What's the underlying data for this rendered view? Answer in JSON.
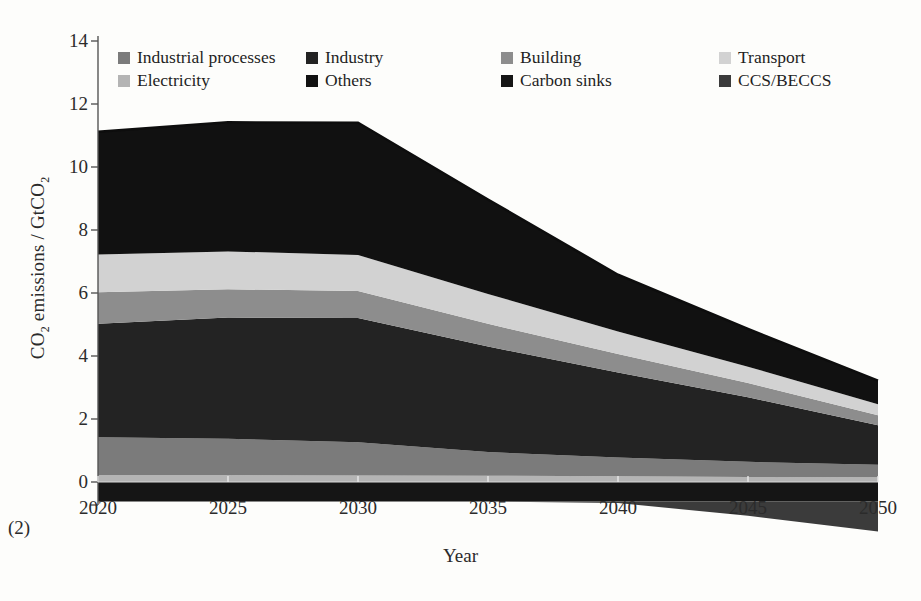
{
  "figure": {
    "corner_note": "(2)",
    "xlabel": "Year",
    "ylabel_html": "CO2 emissions / GtCO2"
  },
  "legend": {
    "position": "top-inside",
    "items": [
      {
        "label": "Industrial processes",
        "color": "#7b7b7b",
        "swatch": "legend-swatch-industrial-processes"
      },
      {
        "label": "Industry",
        "color": "#232323",
        "swatch": "legend-swatch-industry"
      },
      {
        "label": "Building",
        "color": "#8d8d8d",
        "swatch": "legend-swatch-building"
      },
      {
        "label": "Transport",
        "color": "#d2d2d2",
        "swatch": "legend-swatch-transport"
      },
      {
        "label": "Electricity",
        "color": "#b4b4b4",
        "swatch": "legend-swatch-electricity"
      },
      {
        "label": "Others",
        "color": "#111111",
        "swatch": "legend-swatch-others"
      },
      {
        "label": "Carbon sinks",
        "color": "#151515",
        "swatch": "legend-swatch-carbon-sinks"
      },
      {
        "label": "CCS/BECCS",
        "color": "#3b3b3b",
        "swatch": "legend-swatch-ccs-beccs"
      }
    ]
  },
  "axes": {
    "y_ticks": [
      14,
      12,
      10,
      8,
      6,
      4,
      2,
      0
    ],
    "y_tick_labels": [
      "14",
      "12",
      "10",
      "8",
      "6",
      "4",
      "2",
      "0"
    ],
    "ylim": [
      -2.2,
      14
    ],
    "x_ticks": [
      2020,
      2025,
      2030,
      2035,
      2040,
      2045,
      2050
    ],
    "x_tick_labels": [
      "2020",
      "2025",
      "2030",
      "2035",
      "2040",
      "2045",
      "2050"
    ],
    "xlim": [
      2020,
      2050
    ],
    "grid": false
  },
  "chart_data": {
    "type": "area",
    "title": "",
    "xlabel": "Year",
    "ylabel": "CO2 emissions / GtCO2",
    "xlim": [
      2020,
      2050
    ],
    "ylim": [
      -2.2,
      14
    ],
    "grid": false,
    "legend_position": "top-inside",
    "stacked": true,
    "units": "GtCO2",
    "x": [
      2020,
      2025,
      2030,
      2035,
      2040,
      2045,
      2050
    ],
    "series": [
      {
        "name": "Electricity",
        "color": "#b4b4b4",
        "values": [
          0.22,
          0.22,
          0.21,
          0.2,
          0.18,
          0.16,
          0.15
        ]
      },
      {
        "name": "Industrial processes",
        "color": "#7b7b7b",
        "values": [
          1.2,
          1.15,
          1.05,
          0.75,
          0.6,
          0.48,
          0.4
        ]
      },
      {
        "name": "Industry",
        "color": "#232323",
        "values": [
          3.6,
          3.85,
          3.95,
          3.35,
          2.7,
          2.05,
          1.25
        ]
      },
      {
        "name": "Building",
        "color": "#8d8d8d",
        "values": [
          1.0,
          0.9,
          0.85,
          0.72,
          0.58,
          0.45,
          0.32
        ]
      },
      {
        "name": "Transport",
        "color": "#d2d2d2",
        "values": [
          1.2,
          1.2,
          1.15,
          0.95,
          0.72,
          0.52,
          0.35
        ]
      },
      {
        "name": "Others",
        "color": "#111111",
        "values": [
          3.9,
          4.1,
          4.2,
          3.0,
          1.8,
          1.2,
          0.75
        ]
      },
      {
        "name": "Carbon sinks",
        "color": "#151515",
        "values": [
          -0.62,
          -0.62,
          -0.62,
          -0.62,
          -0.62,
          -0.62,
          -0.62
        ]
      },
      {
        "name": "CCS/BECCS",
        "color": "#3b3b3b",
        "values": [
          0.0,
          0.0,
          0.0,
          0.0,
          -0.05,
          -0.45,
          -0.95
        ]
      }
    ],
    "totals_positive": [
      11.12,
      11.42,
      11.41,
      8.97,
      6.58,
      4.86,
      3.22
    ]
  }
}
